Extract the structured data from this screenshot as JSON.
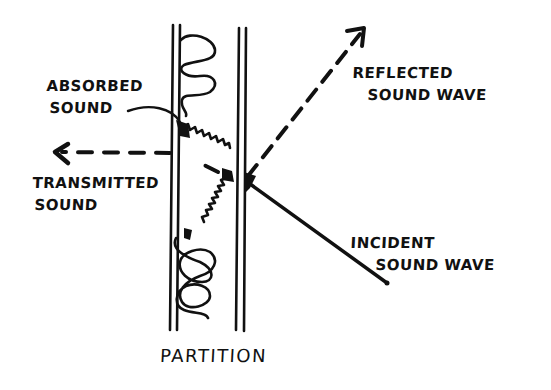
{
  "diagram": {
    "style": "hand-drawn ink sketch",
    "ink_color": "#111111",
    "background": "#ffffff",
    "labels": {
      "absorbed": [
        "ABSORBED",
        "SOUND"
      ],
      "transmitted": [
        "TRANSMITTED",
        "SOUND"
      ],
      "reflected": [
        "REFLECTED",
        "SOUND WAVE"
      ],
      "incident": [
        "INCIDENT",
        "SOUND WAVE"
      ],
      "partition": "PARTITION"
    },
    "elements": [
      {
        "name": "partition-left-leaf",
        "type": "double-line",
        "x": [
          173,
          180
        ],
        "y": [
          25,
          330
        ]
      },
      {
        "name": "partition-right-leaf",
        "type": "double-line",
        "x": [
          238,
          245
        ],
        "y": [
          28,
          330
        ]
      },
      {
        "name": "insulation-upper",
        "type": "coil",
        "y": [
          40,
          115
        ]
      },
      {
        "name": "insulation-lower",
        "type": "coil",
        "y": [
          235,
          320
        ]
      },
      {
        "name": "incident-wave",
        "type": "solid-line",
        "from": [
          387,
          283
        ],
        "to": [
          243,
          180
        ]
      },
      {
        "name": "reflected-wave",
        "type": "dashed-arrow",
        "from": [
          243,
          180
        ],
        "to": [
          365,
          28
        ]
      },
      {
        "name": "transmitted-sound",
        "type": "dashed-arrow",
        "from": [
          222,
          173
        ],
        "to": [
          55,
          152
        ]
      },
      {
        "name": "absorbed-sound",
        "type": "zigzag",
        "from": [
          178,
          122
        ],
        "to": [
          228,
          175
        ]
      },
      {
        "name": "absorbed-sound-down",
        "type": "zigzag",
        "from": [
          228,
          175
        ],
        "to": [
          185,
          232
        ]
      }
    ]
  }
}
